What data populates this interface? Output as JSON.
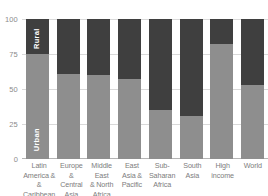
{
  "chart_data": {
    "type": "bar",
    "title": "",
    "subtitle": "",
    "xlabel": "",
    "ylabel": "",
    "ylim": [
      0,
      100
    ],
    "yticks": [
      0,
      25,
      50,
      75,
      100
    ],
    "ytick_labels": [
      "0",
      "25",
      "50",
      "75",
      "100"
    ],
    "grid": true,
    "legend_position": "in-bar",
    "stacked": true,
    "categories": [
      "Latin America & & Caribbean",
      "Europe & Central Asia",
      "Middle East & North Africa",
      "East Asia & Pacific",
      "Sub-Saharan Africa",
      "South Asia",
      "High income",
      "World"
    ],
    "category_lines": [
      [
        "Latin",
        "America & &",
        "Caribbean"
      ],
      [
        "Europe",
        "& Central",
        "Asia"
      ],
      [
        "Middle East",
        "& North",
        "Africa"
      ],
      [
        "East",
        "Asia &",
        "Pacific"
      ],
      [
        "Sub-",
        "Saharan",
        "Africa"
      ],
      [
        "South",
        "Asia"
      ],
      [
        "High",
        "income"
      ],
      [
        "World"
      ]
    ],
    "series": [
      {
        "name": "Urban",
        "color": "#8e8e8e",
        "values": [
          75,
          61,
          60,
          57,
          35,
          31,
          82,
          53
        ]
      },
      {
        "name": "Rural",
        "color": "#3f3f3f",
        "values": [
          25,
          39,
          40,
          43,
          65,
          69,
          18,
          47
        ]
      }
    ],
    "annotations": [
      {
        "text": "Rural",
        "on_bar": 0,
        "segment": "Rural"
      },
      {
        "text": "Urban",
        "on_bar": 0,
        "segment": "Urban"
      }
    ]
  },
  "colors": {
    "urban": "#8e8e8e",
    "rural": "#3f3f3f",
    "grid": "#d9d9d9",
    "axis": "#b5b5b5",
    "tick_text": "#8c8c8c",
    "label_text": "#7d7d7d",
    "background": "#ffffff"
  }
}
